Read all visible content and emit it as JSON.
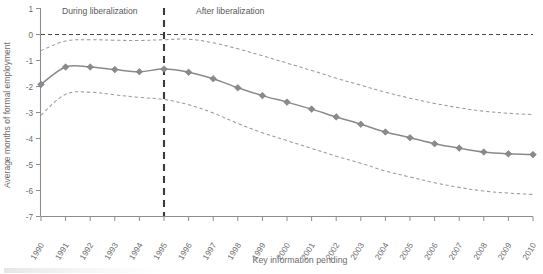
{
  "chart_data": {
    "type": "line",
    "title": "",
    "xlabel": "Key information pending",
    "ylabel": "Average months of formal employment",
    "categories": [
      "1990",
      "1991",
      "1992",
      "1993",
      "1994",
      "1995",
      "1996",
      "1997",
      "1998",
      "1999",
      "2000",
      "2001",
      "2002",
      "2003",
      "2004",
      "2005",
      "2006",
      "2007",
      "2008",
      "2009",
      "2010"
    ],
    "x": [
      1990,
      1991,
      1992,
      1993,
      1994,
      1995,
      1996,
      1997,
      1998,
      1999,
      2000,
      2001,
      2002,
      2003,
      2004,
      2005,
      2006,
      2007,
      2008,
      2009,
      2010
    ],
    "ylim": [
      -7,
      1
    ],
    "xlim": [
      "1990",
      "2010"
    ],
    "yticks": [
      "1",
      "0",
      "-1",
      "-2",
      "-3",
      "-4",
      "-5",
      "-6",
      "-7"
    ],
    "ytick_values": [
      1,
      0,
      -1,
      -2,
      -3,
      -4,
      -5,
      -6,
      -7
    ],
    "grid": false,
    "legend": "none",
    "series": [
      {
        "name": "Point estimate",
        "style": "solid-line-with-diamond-markers",
        "color": "#8a8a8c",
        "values": [
          -1.92,
          -1.25,
          -1.25,
          -1.35,
          -1.43,
          -1.33,
          -1.45,
          -1.7,
          -2.05,
          -2.35,
          -2.6,
          -2.87,
          -3.17,
          -3.45,
          -3.75,
          -3.97,
          -4.2,
          -4.37,
          -4.52,
          -4.59,
          -4.62
        ]
      },
      {
        "name": "Upper confidence bound",
        "style": "dashed-line",
        "color": "#9b9b9d",
        "values": [
          -0.62,
          -0.25,
          -0.2,
          -0.22,
          -0.23,
          -0.2,
          -0.18,
          -0.32,
          -0.55,
          -0.82,
          -1.1,
          -1.38,
          -1.68,
          -1.95,
          -2.22,
          -2.45,
          -2.65,
          -2.82,
          -2.95,
          -3.03,
          -3.08
        ]
      },
      {
        "name": "Lower confidence bound",
        "style": "dashed-line",
        "color": "#9b9b9d",
        "values": [
          -3.1,
          -2.3,
          -2.22,
          -2.32,
          -2.42,
          -2.5,
          -2.7,
          -3.02,
          -3.42,
          -3.78,
          -4.08,
          -4.38,
          -4.68,
          -4.95,
          -5.25,
          -5.48,
          -5.7,
          -5.88,
          -6.02,
          -6.1,
          -6.15
        ]
      }
    ],
    "reference_lines": [
      {
        "name": "zero-line",
        "orientation": "horizontal",
        "value": 0,
        "style": "dashed"
      },
      {
        "name": "liberalization-divider",
        "orientation": "vertical",
        "value": "1995",
        "style": "dashed"
      }
    ],
    "annotations": [
      {
        "name": "during-liberalization",
        "text": "During liberalization",
        "x": "1991",
        "y": 0.78
      },
      {
        "name": "after-liberalization",
        "text": "After liberalization",
        "x": "1996",
        "y": 0.78
      }
    ],
    "colors": {
      "series": "#8a8a8c",
      "confidence": "#9b9b9d",
      "axis": "#8d8d8f",
      "text": "#6b6b6d",
      "divider": "#3a3a3c"
    }
  }
}
